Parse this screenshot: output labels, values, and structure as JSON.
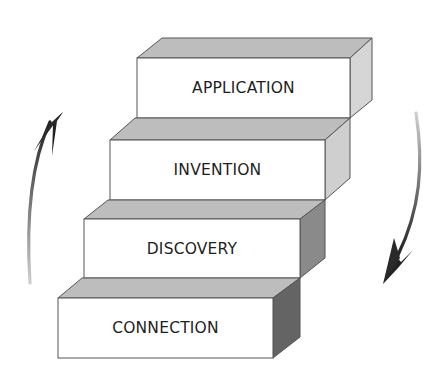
{
  "diagram": {
    "type": "staircase",
    "steps": [
      {
        "label": "CONNECTION",
        "level": 1
      },
      {
        "label": "DISCOVERY",
        "level": 2
      },
      {
        "label": "INVENTION",
        "level": 3
      },
      {
        "label": "APPLICATION",
        "level": 4
      }
    ],
    "arrows": [
      {
        "name": "up-arrow",
        "direction": "up",
        "side": "left"
      },
      {
        "name": "down-arrow",
        "direction": "down",
        "side": "right"
      }
    ],
    "colors": {
      "front": "#ffffff",
      "top": "#bdbdbd",
      "side_light": "#d6d6d6",
      "side_mid": "#a8a8a8",
      "side_dark": "#7a7a7a",
      "side_darkest": "#5e5e5e",
      "outline": "#555555",
      "arrow": "#333333"
    }
  }
}
